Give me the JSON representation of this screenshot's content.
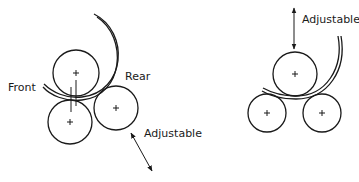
{
  "diagram": {
    "type": "roller-bending-configurations",
    "left_assembly": {
      "labels": {
        "front": "Front",
        "rear": "Rear",
        "adjustable": "Adjustable"
      },
      "rollers": [
        {
          "name": "front-top-roller",
          "cx": 76,
          "cy": 73,
          "r": 23
        },
        {
          "name": "front-bottom-roller",
          "cx": 70,
          "cy": 122,
          "r": 22
        },
        {
          "name": "rear-roller",
          "cx": 116,
          "cy": 108,
          "r": 22
        }
      ]
    },
    "right_assembly": {
      "labels": {
        "adjustable": "Adjustable"
      },
      "rollers": [
        {
          "name": "top-roller",
          "cx": 295,
          "cy": 74,
          "r": 22
        },
        {
          "name": "bottom-left-roller",
          "cx": 267,
          "cy": 113,
          "r": 19
        },
        {
          "name": "bottom-right-roller",
          "cx": 322,
          "cy": 113,
          "r": 19
        }
      ]
    },
    "colors": {
      "line": "#1a1a1a",
      "background": "#ffffff"
    }
  }
}
